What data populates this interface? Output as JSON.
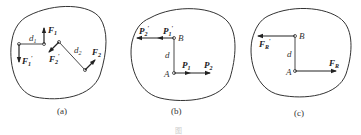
{
  "figure": {
    "caption_faint": "图",
    "panels": [
      {
        "id": "a",
        "caption": "(a)",
        "labels": {
          "F1": "F",
          "F1_sub": "1",
          "F1p": "F",
          "F1p_sub": "1",
          "F1p_prime": "′",
          "F2": "F",
          "F2_sub": "2",
          "F2p": "F",
          "F2p_sub": "2",
          "F2p_prime": "′",
          "d1": "d",
          "d1_sub": "1",
          "d2": "d",
          "d2_sub": "2"
        }
      },
      {
        "id": "b",
        "caption": "(b)",
        "labels": {
          "P2p": "P",
          "P2p_sub": "2",
          "P2p_prime": "′",
          "P1p": "P",
          "P1p_sub": "1",
          "P1p_prime": "′",
          "B": "B",
          "d": "d",
          "A": "A",
          "P1": "P",
          "P1_sub": "1",
          "P2": "P",
          "P2_sub": "2"
        }
      },
      {
        "id": "c",
        "caption": "(c)",
        "labels": {
          "FRp": "F",
          "FRp_sub": "R",
          "FRp_prime": "′",
          "B": "B",
          "d": "d",
          "A": "A",
          "FR": "F",
          "FR_sub": "R"
        }
      }
    ]
  }
}
